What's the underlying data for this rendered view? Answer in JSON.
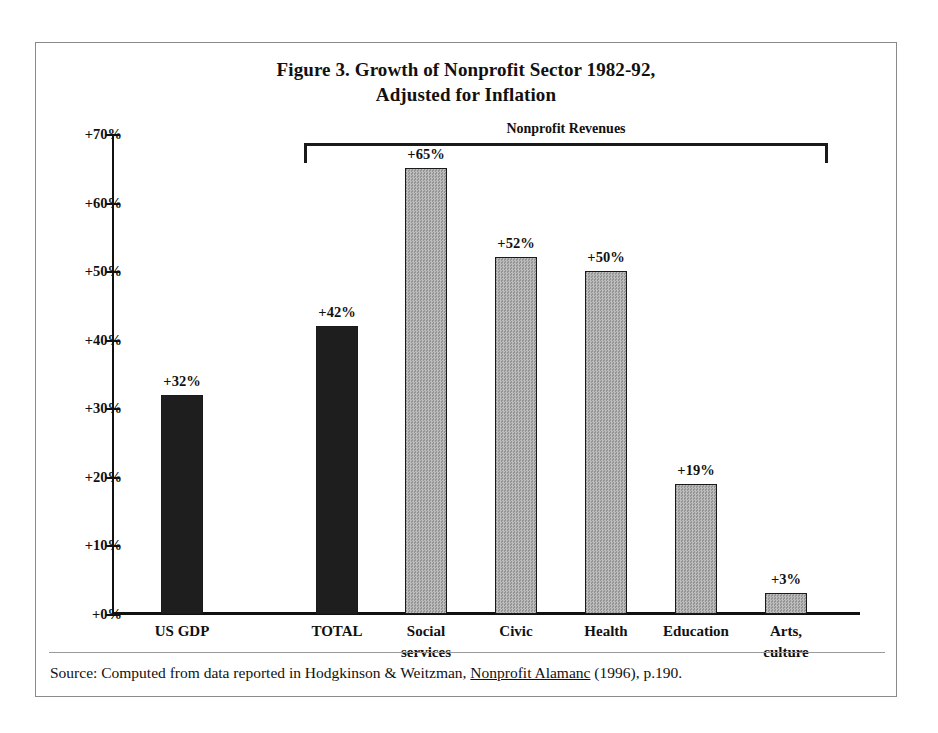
{
  "figure": {
    "title_line1": "Figure 3. Growth of Nonprofit Sector 1982-92,",
    "title_line2": "Adjusted for Inflation",
    "bracket_label": "Nonprofit Revenues",
    "source_prefix": "Source: Computed from data reported in Hodgkinson & Weitzman, ",
    "source_title": "Nonprofit Alamanc",
    "source_suffix": " (1996), p.190."
  },
  "colors": {
    "dark_bar": "#1e1e1e",
    "gray_bar": "#a8a8a8",
    "axis": "#111111",
    "frame": "#8a8a8a",
    "text": "#111111"
  },
  "chart_data": {
    "type": "bar",
    "title": "Figure 3. Growth of Nonprofit Sector 1982-92, Adjusted for Inflation",
    "subtitle": "Adjusted for Inflation",
    "xlabel": "",
    "ylabel": "",
    "ylim": [
      0,
      70
    ],
    "grid": false,
    "legend": "none",
    "ytick_labels": [
      "+70%",
      "+60%",
      "+50%",
      "+40%",
      "+30%",
      "+20%",
      "+10%",
      "+0%"
    ],
    "ytick_values": [
      70,
      60,
      50,
      40,
      30,
      20,
      10,
      0
    ],
    "categories": [
      "US GDP",
      "TOTAL",
      "Social services",
      "Civic",
      "Health",
      "Education",
      "Arts, culture"
    ],
    "values": [
      32,
      42,
      65,
      52,
      50,
      19,
      3
    ],
    "value_labels": [
      "+32%",
      "+42%",
      "+65%",
      "+52%",
      "+50%",
      "+19%",
      "+3%"
    ],
    "bar_styles": [
      "dark",
      "dark",
      "gray",
      "gray",
      "gray",
      "gray",
      "gray"
    ],
    "annotations": [
      {
        "type": "bracket",
        "label": "Nonprofit Revenues",
        "spans_categories": [
          "TOTAL",
          "Social services",
          "Civic",
          "Health",
          "Education",
          "Arts, culture"
        ]
      }
    ]
  },
  "axis": {
    "ticks": [
      {
        "label": "+70%",
        "value": 70
      },
      {
        "label": "+60%",
        "value": 60
      },
      {
        "label": "+50%",
        "value": 50
      },
      {
        "label": "+40%",
        "value": 40
      },
      {
        "label": "+30%",
        "value": 30
      },
      {
        "label": "+20%",
        "value": 20
      },
      {
        "label": "+10%",
        "value": 10
      },
      {
        "label": "+0%",
        "value": 0
      }
    ]
  },
  "bars": [
    {
      "key": "us-gdp",
      "label_line1": "US GDP",
      "label_line2": "",
      "value": 32,
      "value_label": "+32%",
      "style": "dark",
      "center": 146
    },
    {
      "key": "total",
      "label_line1": "TOTAL",
      "label_line2": "",
      "value": 42,
      "value_label": "+42%",
      "style": "dark",
      "center": 301
    },
    {
      "key": "social-services",
      "label_line1": "Social",
      "label_line2": "services",
      "value": 65,
      "value_label": "+65%",
      "style": "gray",
      "center": 390
    },
    {
      "key": "civic",
      "label_line1": "Civic",
      "label_line2": "",
      "value": 52,
      "value_label": "+52%",
      "style": "gray",
      "center": 480
    },
    {
      "key": "health",
      "label_line1": "Health",
      "label_line2": "",
      "value": 50,
      "value_label": "+50%",
      "style": "gray",
      "center": 570
    },
    {
      "key": "education",
      "label_line1": "Education",
      "label_line2": "",
      "value": 19,
      "value_label": "+19%",
      "style": "gray",
      "center": 660
    },
    {
      "key": "arts-culture",
      "label_line1": "Arts,",
      "label_line2": "culture",
      "value": 3,
      "value_label": "+3%",
      "style": "gray",
      "center": 750
    }
  ]
}
